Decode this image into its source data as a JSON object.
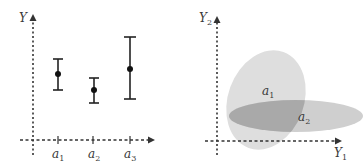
{
  "left_panel": {
    "y_axis_label": "Y",
    "x_ticks": [
      {
        "label": "a",
        "sub": "1"
      },
      {
        "label": "a",
        "sub": "2"
      },
      {
        "label": "a",
        "sub": "3"
      }
    ],
    "error_bars": [
      {
        "group": "a1",
        "mean_y": 74,
        "low_y": 90,
        "high_y": 59
      },
      {
        "group": "a2",
        "mean_y": 90,
        "low_y": 103,
        "high_y": 78
      },
      {
        "group": "a3",
        "mean_y": 69,
        "low_y": 99,
        "high_y": 37
      }
    ]
  },
  "right_panel": {
    "y_axis_label": "Y",
    "y_axis_sub": "2",
    "x_axis_label": "Y",
    "x_axis_sub": "1",
    "ellipses": [
      {
        "label": "a",
        "sub": "1",
        "color": "#dcdcdc"
      },
      {
        "label": "a",
        "sub": "2",
        "color": "#c4c4c4"
      }
    ],
    "overlap_color": "#a8a8a8"
  }
}
